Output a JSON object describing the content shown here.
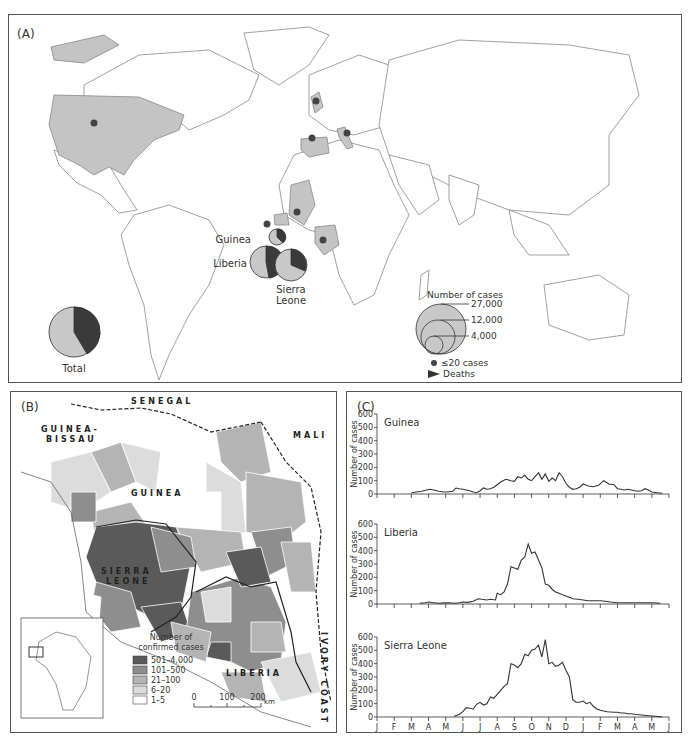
{
  "panel_a": {
    "label": "(A)",
    "countries_labeled": [
      "Guinea",
      "Liberia",
      "Sierra Leone"
    ],
    "pie_labels": {
      "guinea": "Guinea",
      "liberia": "Liberia",
      "sierra_leone_1": "Sierra",
      "sierra_leone_2": "Leone",
      "total": "Total"
    },
    "legend": {
      "title": "Number of cases",
      "sizes": [
        "27,000",
        "12,000",
        "4,000"
      ],
      "small": "≤20 cases",
      "deaths": "Deaths"
    },
    "colors": {
      "cases": "#c8c8c8",
      "deaths": "#3a3a3a",
      "affected_country": "#c4c4c4",
      "dot": "#444444"
    }
  },
  "panel_b": {
    "label": "(B)",
    "place_labels": {
      "senegal": "SENEGAL",
      "guinea_bissau_1": "GUINEA-",
      "guinea_bissau_2": "BISSAU",
      "mali": "MALI",
      "guinea": "GUINEA",
      "sierra_1": "SIERRA",
      "sierra_2": "LEONE",
      "liberia": "LIBERIA",
      "ivory": "IVORY COAST"
    },
    "legend": {
      "title_1": "Number of",
      "title_2": "confirmed cases",
      "classes": [
        {
          "label": "501–4,000",
          "color": "#5a5a5a"
        },
        {
          "label": "101–500",
          "color": "#8e8e8e"
        },
        {
          "label": "21–100",
          "color": "#b4b4b4"
        },
        {
          "label": "6–20",
          "color": "#dcdcdc"
        },
        {
          "label": "1–5",
          "color": "#ffffff"
        }
      ]
    },
    "scale": {
      "ticks": [
        "0",
        "100",
        "200"
      ],
      "unit": "km"
    }
  },
  "panel_c": {
    "label": "(C)",
    "ylabel": "Number of cases",
    "yticks": [
      "0",
      "100",
      "200",
      "300",
      "400",
      "500",
      "600"
    ],
    "months": [
      "J",
      "F",
      "M",
      "A",
      "M",
      "J",
      "J",
      "A",
      "S",
      "O",
      "N",
      "D",
      "J",
      "F",
      "M",
      "A",
      "M",
      "J"
    ],
    "years": [
      "2014",
      "2015"
    ],
    "charts": [
      {
        "title": "Guinea"
      },
      {
        "title": "Liberia"
      },
      {
        "title": "Sierra Leone"
      }
    ]
  },
  "chart_data": [
    {
      "type": "line",
      "title": "Guinea",
      "xlabel": "Month (Jan 2014 – Jun 2015)",
      "ylabel": "Number of cases",
      "ylim": [
        0,
        600
      ],
      "x": [
        2.0,
        2.3,
        2.6,
        2.9,
        3.1,
        3.3,
        3.6,
        3.9,
        4.1,
        4.4,
        4.6,
        4.8,
        5.0,
        5.2,
        5.4,
        5.6,
        5.8,
        6.0,
        6.2,
        6.4,
        6.6,
        6.8,
        7.0,
        7.2,
        7.5,
        7.8,
        8.0,
        8.2,
        8.4,
        8.6,
        8.8,
        9.0,
        9.2,
        9.4,
        9.6,
        9.8,
        10.0,
        10.2,
        10.4,
        10.6,
        10.8,
        11.0,
        11.2,
        11.4,
        11.6,
        11.8,
        12.0,
        12.3,
        12.6,
        12.9,
        13.2,
        13.5,
        13.8,
        14.0,
        14.2,
        14.4,
        14.6,
        14.8,
        15.0,
        15.2,
        15.4,
        15.6,
        15.8,
        16.0,
        16.3,
        16.6
      ],
      "values": [
        10,
        15,
        20,
        30,
        35,
        30,
        20,
        15,
        15,
        20,
        45,
        40,
        35,
        30,
        25,
        15,
        10,
        25,
        45,
        35,
        40,
        50,
        70,
        90,
        110,
        100,
        95,
        130,
        120,
        140,
        110,
        100,
        130,
        160,
        110,
        150,
        95,
        120,
        100,
        160,
        130,
        80,
        50,
        35,
        40,
        50,
        75,
        60,
        55,
        65,
        100,
        75,
        70,
        40,
        35,
        30,
        35,
        30,
        25,
        20,
        25,
        40,
        30,
        15,
        10,
        5
      ]
    },
    {
      "type": "line",
      "title": "Liberia",
      "xlabel": "Month (Jan 2014 – Jun 2015)",
      "ylabel": "Number of cases",
      "ylim": [
        0,
        600
      ],
      "x": [
        2.5,
        2.8,
        3.0,
        3.3,
        3.6,
        3.9,
        4.2,
        4.5,
        4.8,
        5.0,
        5.3,
        5.6,
        5.9,
        6.1,
        6.4,
        6.6,
        6.9,
        7.0,
        7.2,
        7.4,
        7.6,
        7.8,
        8.0,
        8.2,
        8.4,
        8.6,
        8.8,
        9.0,
        9.2,
        9.4,
        9.6,
        9.8,
        10.0,
        10.2,
        10.4,
        10.6,
        10.8,
        11.0,
        11.2,
        11.4,
        11.7,
        12.0,
        12.3,
        12.6,
        13.0,
        13.3,
        13.6,
        14.0,
        14.3,
        14.6,
        15.0,
        15.5,
        16.0,
        16.5
      ],
      "values": [
        5,
        10,
        15,
        10,
        5,
        8,
        10,
        5,
        10,
        15,
        12,
        20,
        40,
        35,
        30,
        35,
        30,
        80,
        70,
        90,
        150,
        280,
        270,
        260,
        330,
        350,
        450,
        380,
        390,
        330,
        270,
        150,
        140,
        110,
        90,
        80,
        70,
        60,
        50,
        40,
        35,
        30,
        25,
        25,
        25,
        20,
        15,
        10,
        10,
        10,
        10,
        10,
        10,
        5
      ]
    },
    {
      "type": "line",
      "title": "Sierra Leone",
      "xlabel": "Month (Jan 2014 – Jun 2015)",
      "ylabel": "Number of cases",
      "ylim": [
        0,
        600
      ],
      "x": [
        4.5,
        4.8,
        5.0,
        5.2,
        5.4,
        5.6,
        5.8,
        6.0,
        6.2,
        6.4,
        6.6,
        6.8,
        7.0,
        7.2,
        7.4,
        7.6,
        7.8,
        8.0,
        8.2,
        8.4,
        8.6,
        8.8,
        9.0,
        9.2,
        9.4,
        9.6,
        9.8,
        10.0,
        10.2,
        10.4,
        10.6,
        10.8,
        11.0,
        11.2,
        11.4,
        11.6,
        11.8,
        12.0,
        12.2,
        12.4,
        12.6,
        12.8,
        13.0,
        13.4,
        13.8,
        14.0,
        14.2,
        14.4,
        14.6,
        14.8,
        15.0,
        15.4,
        15.8,
        16.2,
        16.6
      ],
      "values": [
        5,
        20,
        40,
        70,
        65,
        60,
        95,
        110,
        90,
        100,
        150,
        140,
        170,
        200,
        230,
        250,
        400,
        390,
        370,
        400,
        470,
        460,
        500,
        510,
        540,
        450,
        580,
        400,
        410,
        380,
        390,
        410,
        350,
        300,
        130,
        110,
        110,
        120,
        100,
        110,
        80,
        60,
        50,
        40,
        35,
        35,
        30,
        30,
        25,
        25,
        20,
        15,
        10,
        5,
        0
      ]
    }
  ]
}
